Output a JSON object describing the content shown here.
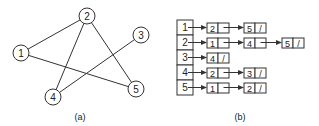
{
  "graph": {
    "caption": "(a)",
    "nodes": [
      {
        "id": "1",
        "x": 21,
        "y": 53
      },
      {
        "id": "2",
        "x": 87,
        "y": 16
      },
      {
        "id": "3",
        "x": 141,
        "y": 35
      },
      {
        "id": "4",
        "x": 53,
        "y": 97
      },
      {
        "id": "5",
        "x": 136,
        "y": 89
      }
    ],
    "edges": [
      [
        "1",
        "2"
      ],
      [
        "1",
        "5"
      ],
      [
        "2",
        "4"
      ],
      [
        "2",
        "5"
      ],
      [
        "3",
        "4"
      ]
    ]
  },
  "adjacency_list": {
    "caption": "(b)",
    "rows": [
      {
        "vertex": "1",
        "list": [
          "2",
          "5"
        ]
      },
      {
        "vertex": "2",
        "list": [
          "1",
          "4",
          "5"
        ]
      },
      {
        "vertex": "3",
        "list": [
          "4"
        ]
      },
      {
        "vertex": "4",
        "list": [
          "2",
          "3"
        ]
      },
      {
        "vertex": "5",
        "list": [
          "1",
          "2"
        ]
      }
    ],
    "null_marker": "/"
  }
}
